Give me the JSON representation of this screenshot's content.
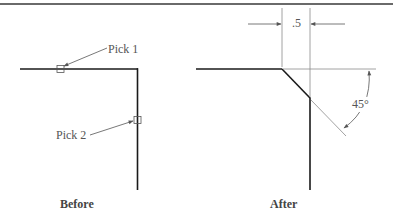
{
  "before": {
    "caption": "Before",
    "pick1_label": "Pick 1",
    "pick2_label": "Pick 2"
  },
  "after": {
    "caption": "After",
    "distance_label": ".5",
    "angle_label": "45°"
  },
  "colors": {
    "object_line": "#1a1a1a",
    "thin_line": "#8a8a8a",
    "label_text": "#555555",
    "top_rule": "#6a6a6a"
  }
}
